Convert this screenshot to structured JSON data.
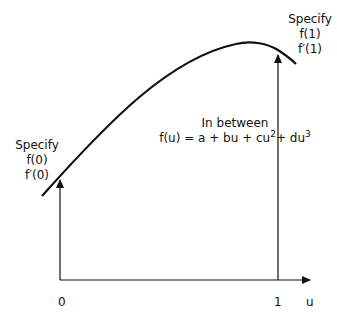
{
  "diagram": {
    "left_annotation": {
      "title": "Specify",
      "line1": "f(0)",
      "line2": "f′(0)"
    },
    "right_annotation": {
      "title": "Specify",
      "line1": "f(1)",
      "line2": "f′(1)"
    },
    "middle_annotation": {
      "title": "In between",
      "formula_prefix": "f(u) = a + bu + cu",
      "exp1": "2",
      "formula_mid": "+ du",
      "exp2": "3"
    },
    "axis": {
      "tick_0": "0",
      "tick_1": "1",
      "label": "u"
    },
    "colors": {
      "stroke": "#111111",
      "background": "#ffffff"
    }
  }
}
